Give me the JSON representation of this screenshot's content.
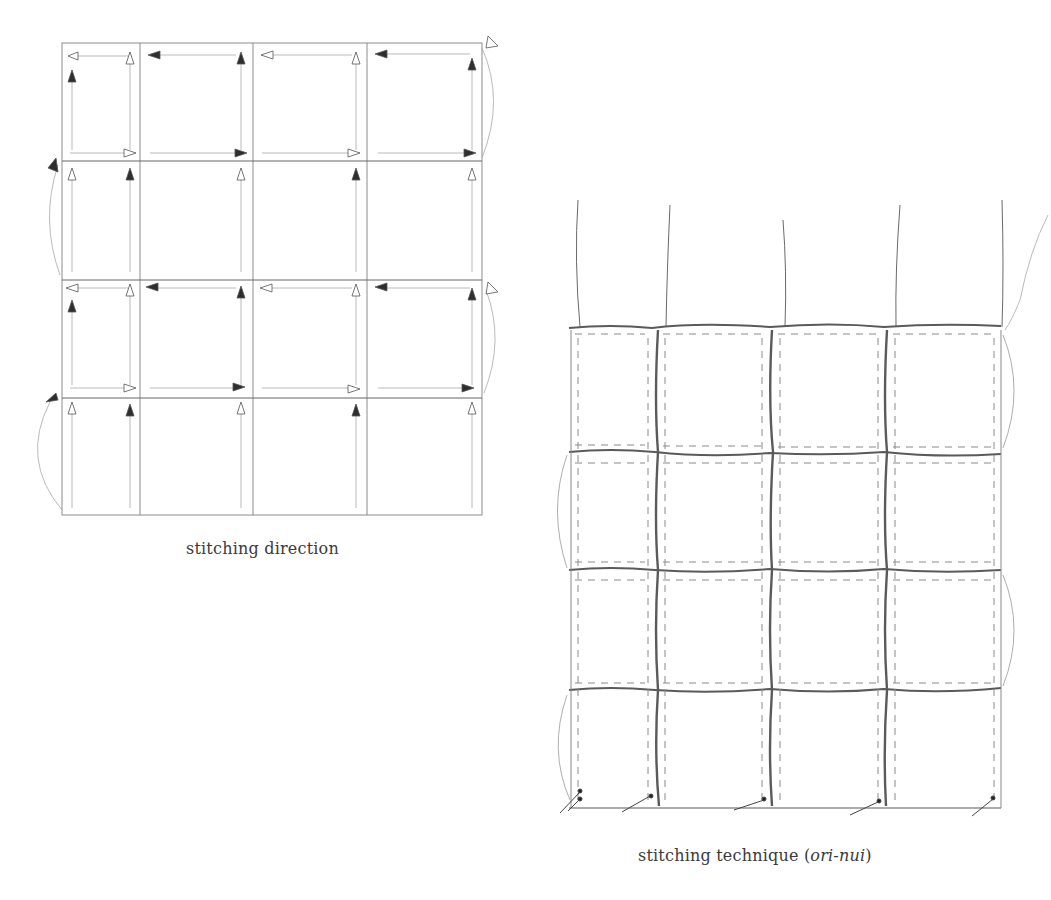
{
  "figures": {
    "left": {
      "caption": "stitching direction",
      "grid": {
        "x": [
          62,
          140,
          253,
          367,
          482
        ],
        "y": [
          43,
          161,
          280,
          398,
          515
        ],
        "rows": 4,
        "cols": 4
      },
      "arrow_legend": {
        "filled": "#2e2e2e",
        "hollow": "#ffffff",
        "line": "#9a9a9a"
      }
    },
    "right": {
      "caption_prefix": "stitching technique (",
      "caption_italic": "ori-nui",
      "caption_suffix": ")",
      "grid": {
        "x": [
          569,
          655,
          770,
          884,
          1000
        ],
        "y": [
          327,
          450,
          567,
          690,
          808
        ],
        "rows": 4,
        "cols": 4
      },
      "thread_color": "#555555",
      "dash_color": "#8a8a8a"
    }
  }
}
